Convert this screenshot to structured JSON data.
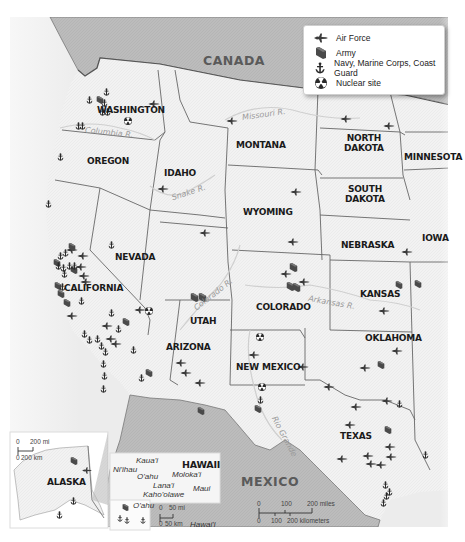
{
  "legend": {
    "items": [
      {
        "icon": "air-force-jet-icon",
        "label": "Air Force"
      },
      {
        "icon": "army-flag-icon",
        "label": "Army"
      },
      {
        "icon": "anchor-icon",
        "label": "Navy, Marine Corps, Coast Guard"
      },
      {
        "icon": "nuclear-radiation-icon",
        "label": "Nuclear site"
      }
    ]
  },
  "countries": {
    "canada": "CANADA",
    "mexico": "MEXICO"
  },
  "states": {
    "washington": "WASHINGTON",
    "oregon": "OREGON",
    "idaho": "IDAHO",
    "montana": "MONTANA",
    "north_dakota_1": "NORTH",
    "north_dakota_2": "DAKOTA",
    "south_dakota_1": "SOUTH",
    "south_dakota_2": "DAKOTA",
    "minnesota": "MINNESOTA",
    "wyoming": "WYOMING",
    "nebraska": "NEBRASKA",
    "iowa": "IOWA",
    "nevada": "NEVADA",
    "utah": "UTAH",
    "colorado": "COLORADO",
    "kansas": "KANSAS",
    "california": "CALIFORNIA",
    "arizona": "ARIZONA",
    "new_mexico": "NEW MEXICO",
    "oklahoma": "OKLAHOMA",
    "texas": "TEXAS",
    "alaska": "ALASKA",
    "hawaii": "HAWAII"
  },
  "rivers": {
    "missouri": "Missouri R.",
    "columbia": "Columbia R.",
    "snake": "Snake R.",
    "colorado": "Colorado R.",
    "arkansas": "Arkansas R.",
    "rio_grande": "Rio Grande"
  },
  "hawaii_islands": {
    "kauai": "Kaua'i",
    "niihau": "Ni'ihau",
    "oahu": "O'ahu",
    "molokai": "Moloka'i",
    "lanai": "Lana'i",
    "maui": "Maui",
    "kahoolawe": "Kaho'olawe",
    "hawaii": "Hawai'i",
    "oahu_inset": "O'ahu"
  },
  "scales": {
    "main": {
      "miles_labels": [
        "0",
        "100",
        "200 miles"
      ],
      "km_labels": [
        "0",
        "100",
        "200 kilometers"
      ]
    },
    "alaska": {
      "miles_labels": [
        "0",
        "200 mi"
      ],
      "km_labels": [
        "0",
        "200 km"
      ]
    },
    "hawaii": {
      "miles_labels": [
        "0",
        "50 mi"
      ],
      "km_labels": [
        "0",
        "50 km"
      ]
    }
  },
  "colors": {
    "land": "#f1f1f1",
    "foreign_land": "#bdbdbd",
    "water": "#e9e9e9",
    "border": "#666666",
    "river": "#c8c8c8",
    "marker": "#3a3a3a"
  }
}
